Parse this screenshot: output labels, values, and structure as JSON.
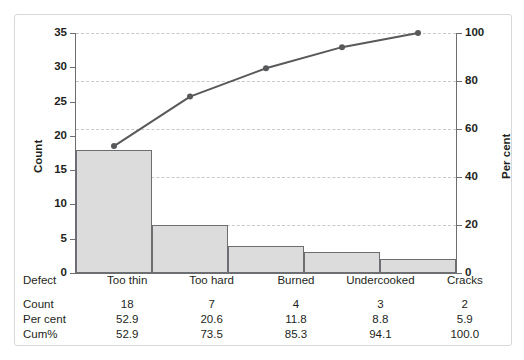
{
  "chart_data": {
    "type": "bar",
    "title": "",
    "subtitle": "",
    "xlabel": "Defect",
    "ylabel": "Count",
    "y2label": "Per cent",
    "categories": [
      "Too thin",
      "Too hard",
      "Burned",
      "Undercooked",
      "Cracks"
    ],
    "values": [
      18,
      7,
      4,
      3,
      2
    ],
    "series": [
      {
        "name": "Count",
        "type": "bar",
        "axis": "left",
        "values": [
          18,
          7,
          4,
          3,
          2
        ]
      },
      {
        "name": "Cum%",
        "type": "line",
        "axis": "right",
        "values": [
          52.9,
          73.5,
          85.3,
          94.1,
          100.0
        ]
      }
    ],
    "percent": [
      52.9,
      20.6,
      11.8,
      8.8,
      5.9
    ],
    "cumulative_percent": [
      52.9,
      73.5,
      85.3,
      94.1,
      100.0
    ],
    "ylim": [
      0,
      35
    ],
    "y2lim": [
      0,
      100
    ],
    "yticks": [
      0,
      5,
      10,
      15,
      20,
      25,
      30,
      35
    ],
    "y2ticks": [
      0,
      20,
      40,
      60,
      80,
      100
    ],
    "grid": true,
    "grid_axis": "y2",
    "legend": "none",
    "colors": {
      "bar_fill": "#dcdcdc",
      "bar_border": "#6d6e71",
      "line": "#58595b",
      "marker": "#58595b",
      "grid": "#c9c9c9",
      "axis": "#6d6e71",
      "frame": "#d8d8d8",
      "text": "#231f20"
    }
  },
  "table": {
    "rows": [
      {
        "label": "Defect",
        "cells": [
          "Too thin",
          "Too hard",
          "Burned",
          "Undercooked",
          "Cracks"
        ]
      },
      {
        "label": "Count",
        "cells": [
          "18",
          "7",
          "4",
          "3",
          "2"
        ]
      },
      {
        "label": "Per cent",
        "cells": [
          "52.9",
          "20.6",
          "11.8",
          "8.8",
          "5.9"
        ]
      },
      {
        "label": "Cum%",
        "cells": [
          "52.9",
          "73.5",
          "85.3",
          "94.1",
          "100.0"
        ]
      }
    ]
  }
}
